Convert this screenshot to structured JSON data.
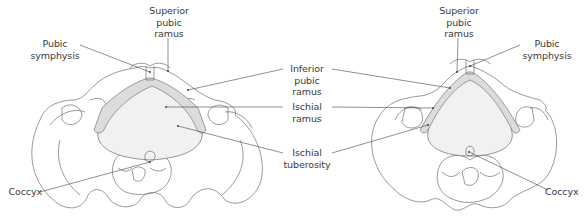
{
  "figure": {
    "views": [
      {
        "id": "left-view",
        "labels": {
          "superior_pubic_ramus": "Superior\npubic\nramus",
          "pubic_symphysis": "Pubic\nsymphysis",
          "coccyx": "Coccyx"
        }
      },
      {
        "id": "right-view",
        "labels": {
          "superior_pubic_ramus": "Superior\npubic\nramus",
          "pubic_symphysis": "Pubic\nsymphysis",
          "coccyx": "Coccyx"
        }
      }
    ],
    "center_labels": {
      "inferior_pubic_ramus": "Inferior\npubic\nramus",
      "ischial_ramus": "Ischial\nramus",
      "ischial_tuberosity": "Ischial\ntuberosity"
    },
    "colors": {
      "outline": "#6f6f6f",
      "pelvic_inlet_fill": "#f1f1f1",
      "ramus_fill": "#dcdcdc",
      "text": "#3a3a3a"
    }
  }
}
